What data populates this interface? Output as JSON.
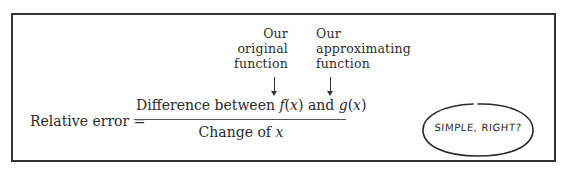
{
  "annotations": {
    "left_label": [
      "Our",
      "original",
      "function"
    ],
    "right_label": [
      "Our",
      "approximating",
      "function"
    ]
  },
  "formula": {
    "lhs": "Relative error =",
    "numerator": {
      "prefix": "Difference between ",
      "f": "f",
      "fx_open": "(",
      "fx_var": "x",
      "fx_close": ")",
      "and": " and ",
      "g": "g",
      "gx_open": "(",
      "gx_var": "x",
      "gx_close": ")"
    },
    "denominator": {
      "prefix": "Change of ",
      "var": "x"
    }
  },
  "speech_bubble": {
    "text": "SIMPLE, RIGHT?"
  },
  "colors": {
    "border": "#333333",
    "text": "#2a2a2a",
    "background": "#ffffff"
  }
}
